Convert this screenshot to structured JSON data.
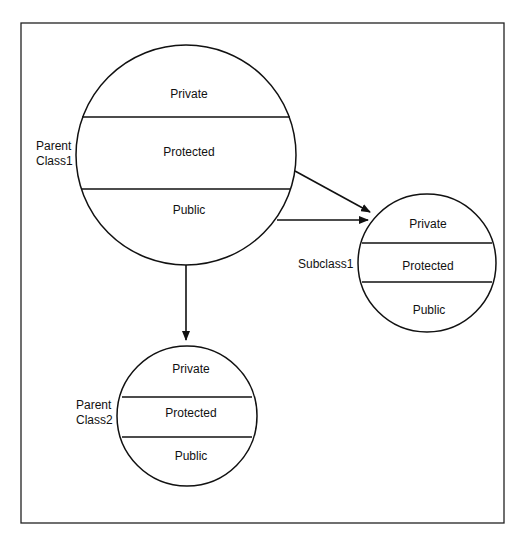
{
  "diagram": {
    "classes": [
      {
        "name": "Parent Class1",
        "name_lines": [
          "Parent",
          "Class1"
        ],
        "sections": [
          "Private",
          "Protected",
          "Public"
        ]
      },
      {
        "name": "Subclass1",
        "name_lines": [
          "Subclass1"
        ],
        "sections": [
          "Private",
          "Protected",
          "Public"
        ]
      },
      {
        "name": "Parent Class2",
        "name_lines": [
          "Parent",
          "Class2"
        ],
        "sections": [
          "Private",
          "Protected",
          "Public"
        ]
      }
    ],
    "edges": [
      {
        "from": "Parent Class1",
        "to": "Subclass1",
        "style": "arrow"
      },
      {
        "from": "Parent Class1",
        "to": "Subclass1",
        "style": "arrow"
      },
      {
        "from": "Parent Class1",
        "to": "Parent Class2",
        "style": "arrow"
      }
    ]
  }
}
